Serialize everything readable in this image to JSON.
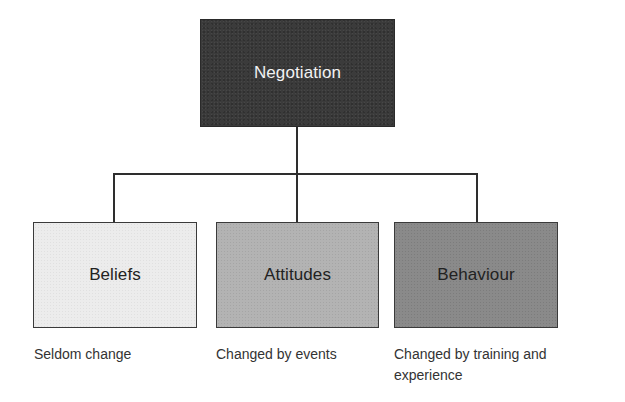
{
  "diagram": {
    "root": {
      "label": "Negotiation",
      "fill": "#3b3b3b",
      "text_color": "#f2f2f2"
    },
    "children": [
      {
        "label": "Beliefs",
        "caption": "Seldom change",
        "fill": "#ececec"
      },
      {
        "label": "Attitudes",
        "caption": "Changed by events",
        "fill": "#b3b3b3"
      },
      {
        "label": "Behaviour",
        "caption": "Changed by training and experience",
        "fill": "#8a8a8a"
      }
    ],
    "connector_color": "#2e2e2e"
  }
}
